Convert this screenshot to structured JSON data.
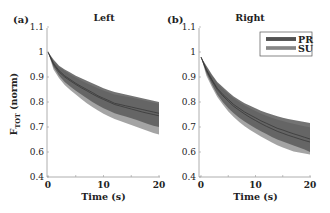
{
  "chart_data": [
    {
      "type": "line",
      "panel_label": "(a)",
      "title": "Left",
      "xlabel": "Time (s)",
      "ylabel": "F_TOT (norm)",
      "xlim": [
        0,
        20
      ],
      "ylim": [
        0.4,
        1.1
      ],
      "x_ticks": [
        "0",
        "10",
        "20"
      ],
      "y_ticks": [
        "0.4",
        "0.6",
        "0.7",
        "0.8",
        "0.9",
        "1",
        "1.1"
      ],
      "y_axis_break": "0.4 to 0.6 compressed",
      "grid": false,
      "x": [
        0,
        1,
        2,
        3,
        4,
        5,
        6,
        7,
        8,
        9,
        10,
        11,
        12,
        13,
        14,
        15,
        16,
        17,
        18,
        19,
        20
      ],
      "series": [
        {
          "name": "PR",
          "mean": [
            1.0,
            0.955,
            0.925,
            0.905,
            0.89,
            0.875,
            0.862,
            0.85,
            0.838,
            0.825,
            0.815,
            0.805,
            0.795,
            0.79,
            0.785,
            0.78,
            0.775,
            0.77,
            0.765,
            0.76,
            0.755
          ],
          "upper": [
            1.0,
            0.97,
            0.945,
            0.93,
            0.918,
            0.905,
            0.895,
            0.885,
            0.875,
            0.865,
            0.855,
            0.847,
            0.84,
            0.835,
            0.83,
            0.825,
            0.82,
            0.815,
            0.81,
            0.805,
            0.8
          ],
          "lower": [
            1.0,
            0.94,
            0.905,
            0.88,
            0.862,
            0.845,
            0.83,
            0.815,
            0.8,
            0.787,
            0.775,
            0.765,
            0.755,
            0.748,
            0.742,
            0.735,
            0.728,
            0.72,
            0.712,
            0.705,
            0.7
          ]
        },
        {
          "name": "SU",
          "mean": [
            1.0,
            0.95,
            0.92,
            0.9,
            0.885,
            0.87,
            0.857,
            0.845,
            0.832,
            0.82,
            0.81,
            0.8,
            0.79,
            0.784,
            0.778,
            0.772,
            0.766,
            0.76,
            0.755,
            0.75,
            0.745
          ],
          "upper": [
            1.0,
            0.965,
            0.94,
            0.924,
            0.91,
            0.898,
            0.886,
            0.875,
            0.865,
            0.855,
            0.846,
            0.838,
            0.83,
            0.826,
            0.822,
            0.818,
            0.813,
            0.808,
            0.803,
            0.798,
            0.793
          ],
          "lower": [
            1.0,
            0.93,
            0.895,
            0.868,
            0.848,
            0.83,
            0.812,
            0.795,
            0.78,
            0.766,
            0.753,
            0.742,
            0.732,
            0.724,
            0.716,
            0.708,
            0.7,
            0.692,
            0.684,
            0.676,
            0.67
          ]
        }
      ]
    },
    {
      "type": "line",
      "panel_label": "(b)",
      "title": "Right",
      "xlabel": "Time (s)",
      "ylabel": "",
      "xlim": [
        0,
        20
      ],
      "ylim": [
        0.4,
        1.1
      ],
      "x_ticks": [
        "0",
        "10",
        "20"
      ],
      "y_ticks": [
        "0.4",
        "0.6",
        "0.7",
        "0.8",
        "0.9",
        "1",
        "1.1"
      ],
      "y_axis_break": "0.4 to 0.6 compressed",
      "grid": false,
      "legend": {
        "position": "upper right",
        "entries": [
          "PR",
          "SU"
        ]
      },
      "x": [
        0,
        1,
        2,
        3,
        4,
        5,
        6,
        7,
        8,
        9,
        10,
        11,
        12,
        13,
        14,
        15,
        16,
        17,
        18,
        19,
        20
      ],
      "series": [
        {
          "name": "PR",
          "mean": [
            0.98,
            0.93,
            0.89,
            0.855,
            0.83,
            0.81,
            0.79,
            0.775,
            0.76,
            0.748,
            0.737,
            0.725,
            0.715,
            0.705,
            0.695,
            0.688,
            0.68,
            0.673,
            0.666,
            0.659,
            0.652
          ],
          "upper": [
            0.98,
            0.945,
            0.91,
            0.88,
            0.86,
            0.84,
            0.822,
            0.808,
            0.795,
            0.785,
            0.775,
            0.765,
            0.757,
            0.75,
            0.743,
            0.737,
            0.732,
            0.728,
            0.724,
            0.72,
            0.716
          ],
          "lower": [
            0.98,
            0.915,
            0.87,
            0.83,
            0.8,
            0.775,
            0.755,
            0.737,
            0.722,
            0.708,
            0.695,
            0.683,
            0.672,
            0.66,
            0.65,
            0.642,
            0.634,
            0.626,
            0.618,
            0.61,
            0.6
          ]
        },
        {
          "name": "SU",
          "mean": [
            0.98,
            0.925,
            0.885,
            0.85,
            0.825,
            0.803,
            0.783,
            0.767,
            0.752,
            0.738,
            0.726,
            0.714,
            0.703,
            0.693,
            0.683,
            0.675,
            0.667,
            0.66,
            0.653,
            0.646,
            0.64
          ],
          "upper": [
            0.98,
            0.94,
            0.905,
            0.875,
            0.852,
            0.832,
            0.815,
            0.8,
            0.787,
            0.775,
            0.764,
            0.754,
            0.745,
            0.737,
            0.73,
            0.724,
            0.718,
            0.713,
            0.708,
            0.703,
            0.699
          ],
          "lower": [
            0.98,
            0.905,
            0.86,
            0.82,
            0.79,
            0.762,
            0.74,
            0.72,
            0.703,
            0.688,
            0.675,
            0.662,
            0.65,
            0.638,
            0.627,
            0.618,
            0.61,
            0.602,
            0.595,
            0.588,
            0.58
          ]
        }
      ]
    }
  ],
  "colors": {
    "pr_band": "#5a5a5a",
    "su_band": "#9a9a9a",
    "mean_line": "#2e2e2e",
    "axis": "#444444",
    "text": "#222222"
  },
  "panels": [
    {
      "x_axis_px": 47,
      "x0_px": 48,
      "x20_px": 159,
      "title_x": 104
    },
    {
      "x_axis_px": 199,
      "x0_px": 201,
      "x20_px": 310,
      "title_x": 250
    }
  ]
}
